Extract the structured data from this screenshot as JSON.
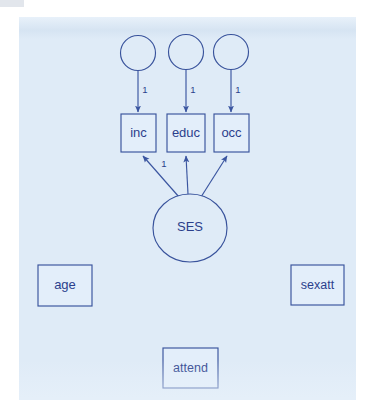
{
  "diagram": {
    "type": "sem-path-diagram",
    "title": "",
    "canvas_color": "#dfebf7",
    "stroke_color": "#39539c",
    "text_color": "#2b3f8c",
    "latent_variables": [
      {
        "id": "ses",
        "label": "SES",
        "shape": "ellipse",
        "cx": 171,
        "cy": 211,
        "rx": 37,
        "ry": 34
      }
    ],
    "residual_terms": [
      {
        "id": "e1",
        "label": "",
        "shape": "circle",
        "cx": 119,
        "cy": 36,
        "r": 17.5
      },
      {
        "id": "e2",
        "label": "",
        "shape": "circle",
        "cx": 167,
        "cy": 35,
        "r": 17.5
      },
      {
        "id": "e3",
        "label": "",
        "shape": "circle",
        "cx": 212,
        "cy": 35,
        "r": 17.5
      }
    ],
    "indicators": [
      {
        "id": "inc",
        "label": "inc",
        "shape": "rect",
        "x": 102,
        "y": 97,
        "w": 35,
        "h": 38
      },
      {
        "id": "educ",
        "label": "educ",
        "shape": "rect",
        "x": 148,
        "y": 97,
        "w": 38,
        "h": 38
      },
      {
        "id": "occ",
        "label": "occ",
        "shape": "rect",
        "x": 195,
        "y": 97,
        "w": 35,
        "h": 38
      }
    ],
    "standalone_boxes": [
      {
        "id": "age",
        "label": "age",
        "shape": "rect",
        "x": 19,
        "y": 248,
        "w": 54,
        "h": 41
      },
      {
        "id": "sexatt",
        "label": "sexatt",
        "shape": "rect",
        "x": 272,
        "y": 248,
        "w": 53,
        "h": 40
      },
      {
        "id": "attend",
        "label": "attend",
        "shape": "rect",
        "x": 144,
        "y": 331,
        "w": 55,
        "h": 40
      }
    ],
    "paths": [
      {
        "id": "e1-to-inc",
        "from": "e1",
        "to": "inc",
        "label": "1",
        "label_x": 126,
        "label_y": 73,
        "x1": 119,
        "y1": 53.5,
        "x2": 119,
        "y2": 95
      },
      {
        "id": "e2-to-educ",
        "from": "e2",
        "to": "educ",
        "label": "1",
        "label_x": 174,
        "label_y": 73,
        "x1": 167,
        "y1": 52.5,
        "x2": 167,
        "y2": 95
      },
      {
        "id": "e3-to-occ",
        "from": "e3",
        "to": "occ",
        "label": "1",
        "label_x": 219,
        "label_y": 73,
        "x1": 212,
        "y1": 52.5,
        "x2": 212,
        "y2": 95
      },
      {
        "id": "ses-to-inc",
        "from": "ses",
        "to": "inc",
        "label": "1",
        "label_x": 145,
        "label_y": 147,
        "x1": 160,
        "y1": 180,
        "x2": 124,
        "y2": 139
      },
      {
        "id": "ses-to-educ",
        "from": "ses",
        "to": "educ",
        "label": "",
        "label_x": 0,
        "label_y": 0,
        "x1": 169,
        "y1": 177,
        "x2": 167,
        "y2": 139
      },
      {
        "id": "ses-to-occ",
        "from": "ses",
        "to": "occ",
        "label": "",
        "label_x": 0,
        "label_y": 0,
        "x1": 182,
        "y1": 180,
        "x2": 208,
        "y2": 139
      }
    ]
  }
}
